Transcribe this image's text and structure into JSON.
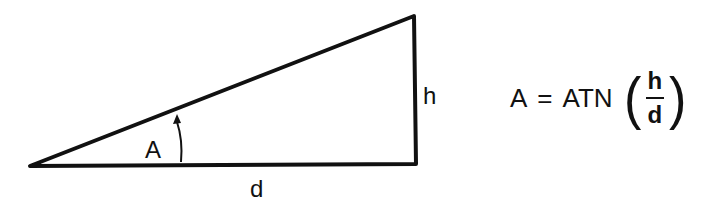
{
  "diagram": {
    "labels": {
      "angle": "A",
      "height": "h",
      "distance": "d"
    },
    "formula": {
      "lhs": "A",
      "equals": "=",
      "function": "ATN",
      "open_paren": "(",
      "numerator": "h",
      "denominator": "d",
      "close_paren": ")"
    },
    "colors": {
      "stroke": "#111111",
      "background": "#ffffff"
    }
  }
}
